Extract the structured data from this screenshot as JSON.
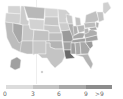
{
  "map": {
    "type": "choropleth",
    "region": "United States",
    "palette": [
      "#d9d9d9",
      "#bdbdbd",
      "#a3a3a3",
      "#8a8a8a",
      "#5f5f5f"
    ]
  },
  "legend": {
    "bins": [
      {
        "label": "0",
        "color": "#dcdcdc"
      },
      {
        "label": "3",
        "color": "#c4c4c4"
      },
      {
        "label": "6",
        "color": "#a8a8a8"
      },
      {
        "label": "9",
        "color": "#8c8c8c"
      },
      {
        "label": ">9",
        "color": "#8c8c8c"
      }
    ],
    "labels": [
      "0",
      "3",
      "6",
      "9",
      ">9"
    ]
  }
}
